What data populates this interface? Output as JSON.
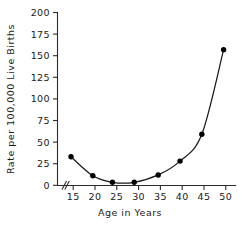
{
  "chart_data": {
    "type": "line",
    "title": "",
    "xlabel": "Age in Years",
    "ylabel": "Rate per 100,000 Live Births",
    "xlim": [
      13,
      51
    ],
    "ylim": [
      0,
      200
    ],
    "xticks": [
      "15",
      "20",
      "25",
      "30",
      "35",
      "40",
      "45",
      "50"
    ],
    "xtick_values": [
      15,
      20,
      25,
      30,
      35,
      40,
      45,
      50
    ],
    "yticks": [
      "0",
      "25",
      "50",
      "75",
      "100",
      "125",
      "150",
      "175",
      "200"
    ],
    "ytick_values": [
      0,
      25,
      50,
      75,
      100,
      125,
      150,
      175,
      200
    ],
    "grid": false,
    "legend": false,
    "axis_break": {
      "axis": "x",
      "symbol": "//",
      "note": "break between origin and first tick"
    },
    "marker": "filled-circle",
    "x": [
      14.5,
      19.5,
      24,
      29,
      34.5,
      39.5,
      44.5,
      49.5
    ],
    "values": [
      33,
      11,
      3.5,
      3.5,
      12,
      28,
      59,
      157
    ],
    "points": [
      {
        "x": 14.5,
        "y": 33
      },
      {
        "x": 19.5,
        "y": 11
      },
      {
        "x": 24,
        "y": 3.5
      },
      {
        "x": 29,
        "y": 3.5
      },
      {
        "x": 34.5,
        "y": 12
      },
      {
        "x": 39.5,
        "y": 28
      },
      {
        "x": 44.5,
        "y": 59
      },
      {
        "x": 49.5,
        "y": 157
      }
    ],
    "colors": {
      "line": "#1a1a1a",
      "marker": "#000000",
      "axis": "#2b2b2b",
      "background": "#ffffff"
    }
  }
}
